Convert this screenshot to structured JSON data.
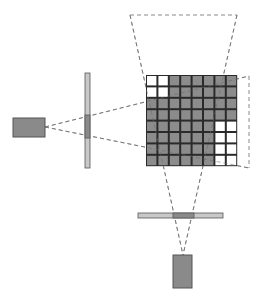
{
  "diagram": {
    "colors": {
      "background": "#ffffff",
      "filled_cell": "#8c8c8c",
      "empty_cell": "#ffffff",
      "grid_line": "#2a2a2a",
      "dashed_line": "#8a8a8a",
      "source_box": "#8a8a8a",
      "bar_light": "#c8c8c8",
      "bar_dark": "#8a8a8a",
      "border": "#555555"
    },
    "grid": {
      "rows": 8,
      "cols": 8,
      "x": 146,
      "y": 75,
      "cell": 11.4,
      "cells": [
        [
          0,
          0,
          1,
          1,
          1,
          1,
          1,
          1
        ],
        [
          0,
          0,
          1,
          1,
          1,
          1,
          1,
          1
        ],
        [
          1,
          1,
          1,
          1,
          1,
          1,
          1,
          1
        ],
        [
          1,
          1,
          1,
          1,
          1,
          1,
          1,
          1
        ],
        [
          1,
          1,
          1,
          1,
          1,
          1,
          0,
          0
        ],
        [
          1,
          1,
          1,
          1,
          1,
          1,
          0,
          0
        ],
        [
          1,
          1,
          1,
          1,
          1,
          1,
          0,
          0
        ],
        [
          1,
          1,
          1,
          1,
          1,
          1,
          0,
          0
        ]
      ]
    },
    "left_source": {
      "x": 13,
      "y": 118,
      "w": 32,
      "h": 19
    },
    "vertical_detector": {
      "x": 85,
      "y": 73,
      "w": 5,
      "h": 95,
      "active_y": 115,
      "active_h": 23
    },
    "bottom_source": {
      "x": 173,
      "y": 255,
      "w": 19,
      "h": 33
    },
    "horizontal_detector": {
      "x": 138,
      "y": 213,
      "w": 85,
      "h": 5,
      "active_x": 173,
      "active_w": 21
    },
    "top_projection": {
      "top_left": [
        130,
        15
      ],
      "top_right": [
        237,
        15
      ]
    },
    "right_projection": {
      "x": 249,
      "top": 76,
      "bottom": 168
    }
  }
}
